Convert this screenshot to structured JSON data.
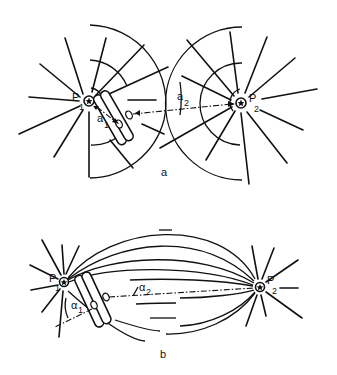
{
  "figure": {
    "panel_a": {
      "label": "a",
      "pole_1": {
        "name": "P",
        "subscript": "1"
      },
      "pole_2": {
        "name": "P",
        "subscript": "2"
      },
      "angle_1": {
        "name": "a",
        "subscript": "1"
      },
      "angle_2": {
        "name": "a",
        "subscript": "2"
      }
    },
    "panel_b": {
      "label": "b",
      "pole_1": {
        "name": "P",
        "subscript": "1"
      },
      "pole_2": {
        "name": "P",
        "subscript": "2"
      },
      "angle_1": {
        "name": "α",
        "subscript": "1"
      },
      "angle_2": {
        "name": "α",
        "subscript": "2"
      }
    },
    "colors": {
      "ink": "#111111",
      "background": "#ffffff"
    }
  }
}
